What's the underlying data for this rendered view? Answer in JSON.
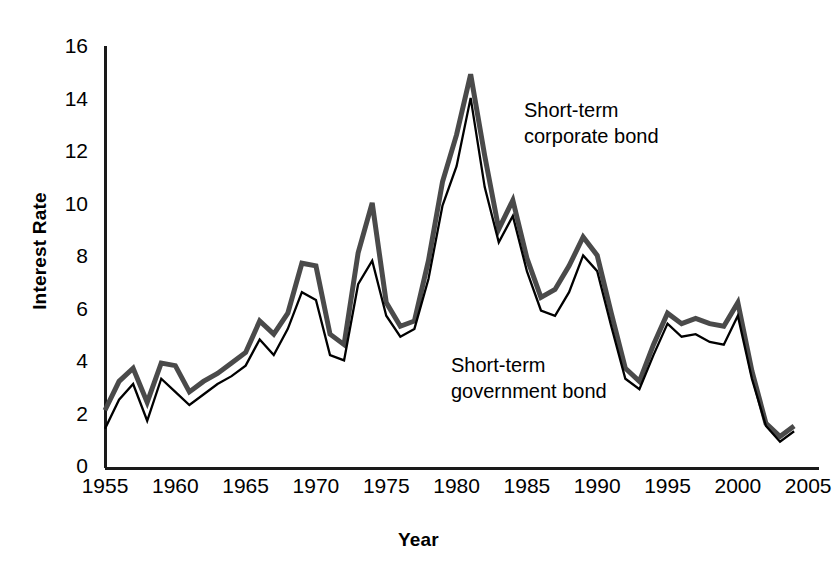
{
  "chart_data": {
    "type": "line",
    "title": "",
    "xlabel": "Year",
    "ylabel": "Interest Rate",
    "xlim": [
      1955,
      2005.7
    ],
    "ylim": [
      0,
      16
    ],
    "xticks": [
      1955,
      1960,
      1965,
      1970,
      1975,
      1980,
      1985,
      1990,
      1995,
      2000,
      2005
    ],
    "yticks": [
      0,
      2,
      4,
      6,
      8,
      10,
      12,
      14,
      16
    ],
    "grid": false,
    "legend_position": "inline-annotations",
    "x": [
      1955,
      1956,
      1957,
      1958,
      1959,
      1960,
      1961,
      1962,
      1963,
      1964,
      1965,
      1966,
      1967,
      1968,
      1969,
      1970,
      1971,
      1972,
      1973,
      1974,
      1975,
      1976,
      1977,
      1978,
      1979,
      1980,
      1981,
      1982,
      1983,
      1984,
      1985,
      1986,
      1987,
      1988,
      1989,
      1990,
      1991,
      1992,
      1993,
      1994,
      1995,
      1996,
      1997,
      1998,
      1999,
      2000,
      2001,
      2002,
      2003,
      2004
    ],
    "series": [
      {
        "name": "Short-term corporate bond",
        "style": "thick-gray",
        "color": "#4a4a4a",
        "linewidth": 5,
        "values": [
          2.2,
          3.3,
          3.8,
          2.5,
          4.0,
          3.9,
          2.9,
          3.3,
          3.6,
          4.0,
          4.4,
          5.6,
          5.1,
          5.9,
          7.8,
          7.7,
          5.1,
          4.7,
          8.2,
          10.1,
          6.3,
          5.4,
          5.6,
          7.9,
          10.9,
          12.7,
          15.0,
          11.9,
          9.1,
          10.2,
          8.0,
          6.5,
          6.8,
          7.7,
          8.8,
          8.1,
          5.9,
          3.8,
          3.3,
          4.7,
          5.9,
          5.5,
          5.7,
          5.5,
          5.4,
          6.3,
          3.7,
          1.7,
          1.2,
          1.6
        ]
      },
      {
        "name": "Short-term government bond",
        "style": "thin-black",
        "color": "#000000",
        "linewidth": 2.3,
        "values": [
          1.5,
          2.6,
          3.2,
          1.8,
          3.4,
          2.9,
          2.4,
          2.8,
          3.2,
          3.5,
          3.9,
          4.9,
          4.3,
          5.3,
          6.7,
          6.4,
          4.3,
          4.1,
          7.0,
          7.9,
          5.8,
          5.0,
          5.3,
          7.2,
          10.0,
          11.5,
          14.1,
          10.7,
          8.6,
          9.6,
          7.5,
          6.0,
          5.8,
          6.7,
          8.1,
          7.5,
          5.4,
          3.4,
          3.0,
          4.3,
          5.5,
          5.0,
          5.1,
          4.8,
          4.7,
          5.8,
          3.4,
          1.6,
          1.0,
          1.4
        ]
      }
    ],
    "annotations": [
      {
        "id": "corporate",
        "text": "Short-term\ncorporate bond",
        "x": 1993.2,
        "y": 13.1
      },
      {
        "id": "government",
        "text": "Short-term\ngovernment bond",
        "x": 1987.7,
        "y": 3.9
      }
    ]
  },
  "axes": {
    "y_title": "Interest Rate",
    "x_title": "Year",
    "y_tick_labels": [
      "16",
      "14",
      "12",
      "10",
      "8",
      "6",
      "4",
      "2",
      "0"
    ],
    "x_tick_labels": [
      "1955",
      "1960",
      "1965",
      "1970",
      "1975",
      "1980",
      "1985",
      "1990",
      "1995",
      "2000",
      "2005"
    ]
  },
  "annotations": {
    "corporate_label": "Short-term\ncorporate bond",
    "government_label": "Short-term\ngovernment bond"
  },
  "colors": {
    "corporate_line": "#4a4a4a",
    "government_line": "#000000",
    "axis": "#1a1a1a",
    "background": "#ffffff"
  }
}
